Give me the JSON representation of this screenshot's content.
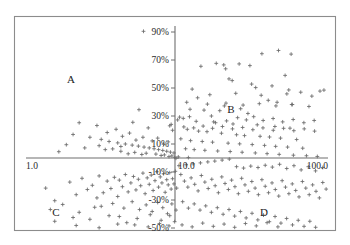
{
  "chart_data": {
    "type": "scatter",
    "title": "",
    "subtitle": "",
    "xlabel": "",
    "ylabel": "",
    "grid": false,
    "legend": null,
    "xscale": "log",
    "yscale": "linear",
    "xlim": [
      1.0,
      100.0
    ],
    "ylim": [
      -0.5,
      1.0
    ],
    "x_axis": {
      "start_label": "1.0",
      "origin_label": "10.0",
      "end_label": "100.0",
      "ticks": [
        "1.0",
        "10.0",
        "100.0"
      ],
      "tick_values": [
        1.0,
        10.0,
        100.0
      ]
    },
    "y_axis": {
      "ticks": [
        "90%",
        "70%",
        "50%",
        "30%",
        "10%",
        "-10%",
        "-30%",
        "-50%"
      ],
      "tick_values": [
        0.9,
        0.7,
        0.5,
        0.3,
        0.1,
        -0.1,
        -0.3,
        -0.5
      ]
    },
    "annotations": [
      {
        "label": "A",
        "quadrant": "upper-left",
        "x": 2.6,
        "y": 0.6
      },
      {
        "label": "B",
        "quadrant": "upper-right",
        "x": 24.0,
        "y": 0.33
      },
      {
        "label": "C",
        "quadrant": "lower-left",
        "x": 2.2,
        "y": -0.42
      },
      {
        "label": "D",
        "quadrant": "lower-right",
        "x": 42.0,
        "y": -0.42
      }
    ],
    "marker_style": "plus",
    "marker_color": "#6a6a6a",
    "axis_color": "#6e6e6e",
    "frame_color": "#8c8c8c",
    "n_points": 420,
    "points": [
      [
        6.0,
        0.905
      ],
      [
        5.6,
        0.345
      ],
      [
        5.1,
        0.255
      ],
      [
        10.4,
        0.292
      ],
      [
        10.1,
        0.272
      ],
      [
        14.4,
        0.655
      ],
      [
        18.2,
        0.676
      ],
      [
        20.4,
        0.665
      ],
      [
        21.0,
        0.637
      ],
      [
        25.8,
        0.672
      ],
      [
        30.4,
        0.66
      ],
      [
        36.5,
        0.745
      ],
      [
        47.0,
        0.768
      ],
      [
        57.0,
        0.742
      ],
      [
        22.1,
        0.565
      ],
      [
        23.2,
        0.553
      ],
      [
        31.2,
        0.528
      ],
      [
        52.0,
        0.59
      ],
      [
        12.6,
        0.492
      ],
      [
        33.2,
        0.503
      ],
      [
        42.6,
        0.515
      ],
      [
        55.0,
        0.486
      ],
      [
        66.0,
        0.47
      ],
      [
        13.7,
        0.43
      ],
      [
        40.2,
        0.412
      ],
      [
        46.0,
        0.398
      ],
      [
        57.5,
        0.382
      ],
      [
        20.6,
        0.372
      ],
      [
        26.4,
        0.352
      ],
      [
        29.5,
        0.318
      ],
      [
        16.9,
        0.3
      ],
      [
        12.1,
        0.295
      ],
      [
        11.0,
        0.283
      ],
      [
        18.0,
        0.252
      ],
      [
        23.5,
        0.243
      ],
      [
        34.0,
        0.237
      ],
      [
        44.5,
        0.225
      ],
      [
        56.0,
        0.213
      ],
      [
        11.7,
        0.205
      ],
      [
        13.9,
        0.192
      ],
      [
        15.8,
        0.188
      ],
      [
        19.7,
        0.177
      ],
      [
        24.8,
        0.166
      ],
      [
        28.0,
        0.16
      ],
      [
        35.5,
        0.155
      ],
      [
        41.0,
        0.15
      ],
      [
        48.5,
        0.142
      ],
      [
        62.0,
        0.132
      ],
      [
        10.6,
        0.137
      ],
      [
        12.3,
        0.124
      ],
      [
        14.7,
        0.118
      ],
      [
        17.2,
        0.113
      ],
      [
        21.8,
        0.106
      ],
      [
        26.0,
        0.101
      ],
      [
        31.5,
        0.096
      ],
      [
        38.0,
        0.09
      ],
      [
        45.0,
        0.083
      ],
      [
        54.0,
        0.078
      ],
      [
        68.0,
        0.07
      ],
      [
        11.4,
        0.066
      ],
      [
        13.0,
        0.06
      ],
      [
        15.3,
        0.055
      ],
      [
        18.6,
        0.05
      ],
      [
        22.5,
        0.046
      ],
      [
        27.0,
        0.041
      ],
      [
        33.0,
        0.036
      ],
      [
        39.5,
        0.031
      ],
      [
        47.5,
        0.026
      ],
      [
        59.0,
        0.02
      ],
      [
        72.0,
        0.016
      ],
      [
        85.0,
        0.011
      ],
      [
        10.2,
        0.008
      ],
      [
        11.9,
        0.003
      ],
      [
        2.05,
        0.168
      ],
      [
        2.65,
        0.148
      ],
      [
        3.15,
        0.133
      ],
      [
        3.55,
        0.118
      ],
      [
        4.05,
        0.108
      ],
      [
        4.55,
        0.1
      ],
      [
        5.05,
        0.092
      ],
      [
        5.55,
        0.085
      ],
      [
        6.05,
        0.078
      ],
      [
        6.55,
        0.072
      ],
      [
        7.05,
        0.066
      ],
      [
        7.55,
        0.06
      ],
      [
        8.05,
        0.054
      ],
      [
        8.55,
        0.048
      ],
      [
        9.05,
        0.042
      ],
      [
        9.55,
        0.036
      ],
      [
        3.35,
        0.06
      ],
      [
        4.25,
        0.048
      ],
      [
        5.25,
        0.04
      ],
      [
        6.25,
        0.034
      ],
      [
        7.25,
        0.028
      ],
      [
        8.25,
        0.022
      ],
      [
        9.25,
        0.015
      ],
      [
        6.45,
        0.215
      ],
      [
        8.95,
        0.23
      ],
      [
        9.15,
        0.24
      ],
      [
        9.35,
        0.198
      ],
      [
        4.75,
        0.03
      ],
      [
        5.85,
        0.025
      ],
      [
        7.85,
        0.018
      ],
      [
        8.85,
        0.01
      ],
      [
        9.65,
        0.005
      ],
      [
        9.85,
        -0.002
      ],
      [
        1.35,
        -0.215
      ],
      [
        1.55,
        -0.305
      ],
      [
        1.95,
        -0.172
      ],
      [
        2.15,
        -0.262
      ],
      [
        2.35,
        -0.145
      ],
      [
        2.55,
        -0.225
      ],
      [
        2.75,
        -0.195
      ],
      [
        2.95,
        -0.285
      ],
      [
        3.05,
        -0.128
      ],
      [
        3.25,
        -0.248
      ],
      [
        3.45,
        -0.165
      ],
      [
        3.65,
        -0.218
      ],
      [
        3.85,
        -0.138
      ],
      [
        4.05,
        -0.275
      ],
      [
        4.15,
        -0.158
      ],
      [
        4.35,
        -0.205
      ],
      [
        4.55,
        -0.118
      ],
      [
        4.75,
        -0.242
      ],
      [
        4.95,
        -0.178
      ],
      [
        5.15,
        -0.132
      ],
      [
        5.35,
        -0.228
      ],
      [
        5.55,
        -0.152
      ],
      [
        5.75,
        -0.198
      ],
      [
        5.95,
        -0.108
      ],
      [
        6.15,
        -0.255
      ],
      [
        6.35,
        -0.142
      ],
      [
        6.55,
        -0.188
      ],
      [
        6.75,
        -0.122
      ],
      [
        6.95,
        -0.232
      ],
      [
        7.15,
        -0.162
      ],
      [
        7.35,
        -0.098
      ],
      [
        7.55,
        -0.208
      ],
      [
        7.75,
        -0.135
      ],
      [
        7.95,
        -0.178
      ],
      [
        8.15,
        -0.112
      ],
      [
        8.35,
        -0.245
      ],
      [
        8.55,
        -0.155
      ],
      [
        8.75,
        -0.192
      ],
      [
        8.95,
        -0.105
      ],
      [
        9.15,
        -0.222
      ],
      [
        9.35,
        -0.148
      ],
      [
        9.55,
        -0.185
      ],
      [
        9.75,
        -0.095
      ],
      [
        9.95,
        -0.215
      ],
      [
        3.15,
        -0.345
      ],
      [
        3.75,
        -0.325
      ],
      [
        4.45,
        -0.358
      ],
      [
        5.05,
        -0.312
      ],
      [
        5.65,
        -0.368
      ],
      [
        6.25,
        -0.335
      ],
      [
        6.85,
        -0.382
      ],
      [
        7.45,
        -0.318
      ],
      [
        8.05,
        -0.355
      ],
      [
        8.65,
        -0.398
      ],
      [
        9.25,
        -0.328
      ],
      [
        9.85,
        -0.372
      ],
      [
        4.15,
        -0.418
      ],
      [
        5.45,
        -0.432
      ],
      [
        6.65,
        -0.405
      ],
      [
        7.85,
        -0.445
      ],
      [
        8.95,
        -0.412
      ],
      [
        9.65,
        -0.455
      ],
      [
        2.25,
        -0.388
      ],
      [
        2.85,
        -0.352
      ],
      [
        3.55,
        -0.412
      ],
      [
        1.75,
        -0.332
      ],
      [
        2.05,
        -0.425
      ],
      [
        1.45,
        -0.368
      ],
      [
        5.25,
        -0.478
      ],
      [
        6.45,
        -0.492
      ],
      [
        7.65,
        -0.468
      ],
      [
        8.85,
        -0.485
      ],
      [
        4.65,
        -0.462
      ],
      [
        10.6,
        -0.118
      ],
      [
        11.2,
        -0.165
      ],
      [
        11.8,
        -0.208
      ],
      [
        12.4,
        -0.142
      ],
      [
        13.1,
        -0.188
      ],
      [
        13.8,
        -0.235
      ],
      [
        14.5,
        -0.125
      ],
      [
        15.3,
        -0.172
      ],
      [
        16.1,
        -0.218
      ],
      [
        17.0,
        -0.152
      ],
      [
        17.9,
        -0.198
      ],
      [
        18.8,
        -0.248
      ],
      [
        19.8,
        -0.135
      ],
      [
        20.8,
        -0.182
      ],
      [
        21.9,
        -0.225
      ],
      [
        23.0,
        -0.158
      ],
      [
        24.2,
        -0.205
      ],
      [
        25.5,
        -0.255
      ],
      [
        26.8,
        -0.145
      ],
      [
        28.2,
        -0.192
      ],
      [
        29.7,
        -0.238
      ],
      [
        31.3,
        -0.168
      ],
      [
        32.9,
        -0.215
      ],
      [
        34.6,
        -0.262
      ],
      [
        36.5,
        -0.155
      ],
      [
        38.4,
        -0.202
      ],
      [
        40.4,
        -0.248
      ],
      [
        42.6,
        -0.178
      ],
      [
        44.8,
        -0.225
      ],
      [
        47.2,
        -0.272
      ],
      [
        49.7,
        -0.162
      ],
      [
        52.3,
        -0.208
      ],
      [
        55.1,
        -0.255
      ],
      [
        58.0,
        -0.185
      ],
      [
        61.1,
        -0.232
      ],
      [
        64.3,
        -0.278
      ],
      [
        67.7,
        -0.168
      ],
      [
        71.3,
        -0.215
      ],
      [
        75.1,
        -0.262
      ],
      [
        79.1,
        -0.192
      ],
      [
        83.3,
        -0.238
      ],
      [
        87.7,
        -0.285
      ],
      [
        92.3,
        -0.175
      ],
      [
        97.2,
        -0.222
      ],
      [
        10.9,
        -0.312
      ],
      [
        11.9,
        -0.358
      ],
      [
        13.0,
        -0.328
      ],
      [
        14.2,
        -0.372
      ],
      [
        15.5,
        -0.342
      ],
      [
        16.9,
        -0.388
      ],
      [
        18.5,
        -0.355
      ],
      [
        20.2,
        -0.402
      ],
      [
        22.1,
        -0.368
      ],
      [
        24.1,
        -0.415
      ],
      [
        26.3,
        -0.382
      ],
      [
        28.7,
        -0.428
      ],
      [
        31.4,
        -0.395
      ],
      [
        34.3,
        -0.442
      ],
      [
        37.4,
        -0.408
      ],
      [
        40.9,
        -0.455
      ],
      [
        44.6,
        -0.418
      ],
      [
        48.8,
        -0.465
      ],
      [
        53.2,
        -0.432
      ],
      [
        58.2,
        -0.478
      ],
      [
        63.5,
        -0.445
      ],
      [
        69.4,
        -0.488
      ],
      [
        75.8,
        -0.452
      ],
      [
        82.8,
        -0.495
      ],
      [
        10.3,
        -0.055
      ],
      [
        11.5,
        -0.048
      ],
      [
        12.8,
        -0.042
      ],
      [
        14.3,
        -0.035
      ],
      [
        16.0,
        -0.028
      ],
      [
        17.8,
        -0.022
      ],
      [
        19.9,
        -0.015
      ],
      [
        22.2,
        -0.008
      ],
      [
        24.8,
        -0.062
      ],
      [
        27.6,
        -0.072
      ],
      [
        30.8,
        -0.058
      ],
      [
        34.4,
        -0.068
      ],
      [
        38.4,
        -0.052
      ],
      [
        42.8,
        -0.065
      ],
      [
        47.8,
        -0.045
      ],
      [
        53.3,
        -0.075
      ],
      [
        59.5,
        -0.055
      ],
      [
        66.4,
        -0.085
      ],
      [
        74.1,
        -0.062
      ],
      [
        82.7,
        -0.092
      ],
      [
        92.3,
        -0.068
      ],
      [
        2.25,
        0.252
      ],
      [
        2.95,
        0.232
      ],
      [
        3.45,
        0.182
      ],
      [
        3.95,
        0.205
      ],
      [
        4.35,
        0.155
      ],
      [
        4.85,
        0.178
      ],
      [
        5.35,
        0.128
      ],
      [
        5.95,
        0.148
      ],
      [
        6.85,
        0.122
      ],
      [
        7.45,
        0.142
      ],
      [
        8.15,
        0.098
      ],
      [
        8.75,
        0.115
      ],
      [
        1.85,
        0.095
      ],
      [
        2.45,
        0.072
      ],
      [
        3.05,
        0.088
      ],
      [
        3.75,
        0.065
      ],
      [
        4.25,
        0.082
      ],
      [
        1.65,
        0.045
      ],
      [
        12.2,
        0.348
      ],
      [
        15.1,
        0.342
      ],
      [
        19.2,
        0.338
      ],
      [
        13.4,
        0.262
      ],
      [
        17.5,
        0.258
      ],
      [
        21.3,
        0.265
      ],
      [
        25.2,
        0.288
      ],
      [
        28.8,
        0.272
      ],
      [
        32.2,
        0.295
      ],
      [
        37.2,
        0.268
      ],
      [
        43.3,
        0.282
      ],
      [
        50.1,
        0.258
      ],
      [
        58.8,
        0.275
      ],
      [
        69.2,
        0.252
      ],
      [
        81.0,
        0.268
      ],
      [
        11.1,
        0.222
      ],
      [
        12.9,
        0.215
      ],
      [
        14.9,
        0.228
      ],
      [
        17.2,
        0.212
      ],
      [
        20.0,
        0.225
      ],
      [
        23.3,
        0.208
      ],
      [
        27.2,
        0.218
      ],
      [
        31.8,
        0.202
      ],
      [
        37.1,
        0.215
      ],
      [
        43.4,
        0.198
      ],
      [
        50.8,
        0.212
      ],
      [
        59.4,
        0.195
      ],
      [
        69.6,
        0.208
      ],
      [
        81.5,
        0.192
      ],
      [
        10.8,
        -0.478
      ],
      [
        12.6,
        -0.492
      ],
      [
        14.8,
        -0.465
      ],
      [
        17.4,
        -0.488
      ],
      [
        20.5,
        -0.472
      ],
      [
        24.1,
        -0.495
      ],
      [
        28.4,
        -0.468
      ],
      [
        33.5,
        -0.485
      ],
      [
        39.5,
        -0.462
      ],
      [
        46.6,
        -0.492
      ],
      [
        2.15,
        -0.482
      ],
      [
        3.05,
        -0.498
      ],
      [
        4.05,
        -0.472
      ],
      [
        1.55,
        -0.452
      ],
      [
        2.65,
        -0.438
      ],
      [
        9.05,
        -0.512
      ],
      [
        8.35,
        -0.528
      ],
      [
        11.6,
        0.398
      ],
      [
        15.9,
        0.385
      ],
      [
        21.1,
        0.392
      ],
      [
        27.4,
        0.378
      ],
      [
        35.1,
        0.388
      ],
      [
        45.2,
        0.372
      ],
      [
        58.1,
        0.382
      ],
      [
        74.8,
        0.368
      ],
      [
        16.5,
        0.452
      ],
      [
        24.5,
        0.462
      ],
      [
        36.1,
        0.448
      ],
      [
        53.4,
        0.458
      ],
      [
        78.2,
        0.442
      ],
      [
        88.5,
        0.478
      ],
      [
        94.0,
        0.485
      ]
    ]
  }
}
